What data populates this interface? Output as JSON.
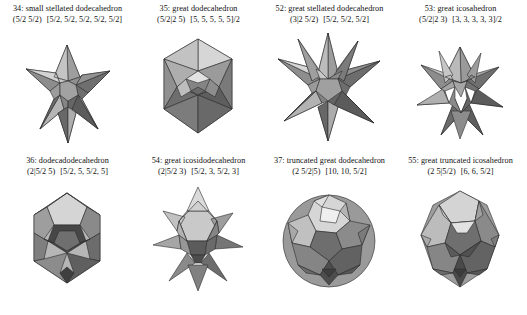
{
  "plate": {
    "rows": [
      {
        "cells": [
          {
            "index": "34:",
            "name": "small stellated dodecahedron",
            "wythoff": "(5/2 5/2)",
            "config": "[5/2, 5/2, 5/2, 5/2, 5/2]",
            "solid": "small-stellated-dodecahedron"
          },
          {
            "index": "35:",
            "name": "great dodecahedron",
            "wythoff": "(5/2|2 5)",
            "config": "[5, 5, 5, 5, 5]/2",
            "solid": "great-dodecahedron"
          },
          {
            "index": "52:",
            "name": "great stellated dodecahedron",
            "wythoff": "(3|2 5/2)",
            "config": "[5/2, 5/2, 5/2]",
            "solid": "great-stellated-dodecahedron"
          },
          {
            "index": "53:",
            "name": "great icosahedron",
            "wythoff": "(5/2|2 3)",
            "config": "[3, 3, 3, 3, 3]/2",
            "solid": "great-icosahedron"
          }
        ]
      },
      {
        "cells": [
          {
            "index": "36:",
            "name": "dodecadodecahedron",
            "wythoff": "(2|5/2 5)",
            "config": "[5/2, 5, 5/2, 5]",
            "solid": "dodecadodecahedron"
          },
          {
            "index": "54:",
            "name": "great icosidodecahedron",
            "wythoff": "(2|5/2 3)",
            "config": "[5/2, 3, 5/2, 3]",
            "solid": "great-icosidodecahedron"
          },
          {
            "index": "37:",
            "name": "truncated great dodecahedron",
            "wythoff": "(2 5/2|5)",
            "config": "[10, 10, 5/2]",
            "solid": "truncated-great-dodecahedron"
          },
          {
            "index": "55:",
            "name": "great truncated icosahedron",
            "wythoff": "(2 5|5/2)",
            "config": "[6, 6, 5/2]",
            "solid": "great-truncated-icosahedron"
          }
        ]
      }
    ]
  },
  "palette": {
    "background": "#ffffff",
    "ink": "#111111",
    "outline": "#2b2b2b",
    "shade_lightest": "#e6e6e6",
    "shade_light": "#cfcfcf",
    "shade_mid": "#a9a9a9",
    "shade_dark": "#7d7d7d",
    "shade_darker": "#585858",
    "shade_darkest": "#3a3a3a"
  }
}
